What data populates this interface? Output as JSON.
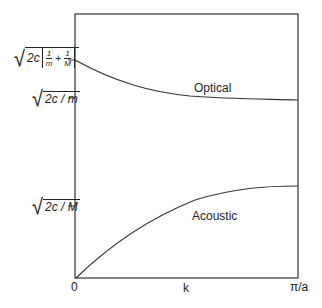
{
  "diagram": {
    "type": "phonon dispersion relation",
    "x_axis": {
      "label": "k",
      "ticks": [
        "0",
        "π/a"
      ]
    },
    "y_axis": {
      "ticks": [
        {
          "id": "top",
          "label_prefix": "2c",
          "frac1_num": "1",
          "frac1_den": "m",
          "plus": "+",
          "frac2_num": "1",
          "frac2_den": "M"
        },
        {
          "id": "mid",
          "label": "2c / m"
        },
        {
          "id": "low",
          "label": "2c / M"
        }
      ]
    },
    "curves": [
      {
        "name": "optical",
        "label": "Optical"
      },
      {
        "name": "acoustic",
        "label": "Acoustic"
      }
    ],
    "colors": {
      "line": "#333333",
      "background": "#ffffff"
    }
  }
}
